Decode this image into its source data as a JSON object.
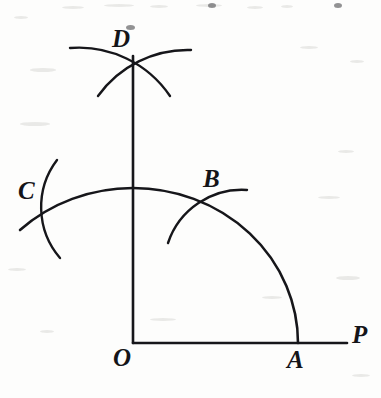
{
  "figure": {
    "canvas": {
      "width": 381,
      "height": 398
    },
    "background_color": "#fdfdfc",
    "ink_color": "#16161a"
  },
  "labels": [
    {
      "id": "D",
      "text": "D",
      "x": 112,
      "y": 26,
      "name": "point-label-d"
    },
    {
      "id": "C",
      "text": "C",
      "x": 18,
      "y": 178,
      "name": "point-label-c"
    },
    {
      "id": "B",
      "text": "B",
      "x": 203,
      "y": 166,
      "name": "point-label-b"
    },
    {
      "id": "O",
      "text": "O",
      "x": 113,
      "y": 345,
      "name": "point-label-o"
    },
    {
      "id": "A",
      "text": "A",
      "x": 287,
      "y": 347,
      "name": "point-label-a"
    },
    {
      "id": "P",
      "text": "P",
      "x": 352,
      "y": 322,
      "name": "point-label-p"
    }
  ],
  "points": {
    "O": {
      "x": 133,
      "y": 343
    },
    "A": {
      "x": 298,
      "y": 343
    },
    "P": {
      "x": 347,
      "y": 343
    },
    "B": {
      "x": 213,
      "y": 206
    },
    "C": {
      "x": 42,
      "y": 208
    },
    "D": {
      "x": 133,
      "y": 70
    },
    "arc_top": {
      "x": 133,
      "y": 188
    }
  },
  "geometry": {
    "horizontal_ray": {
      "x1": 133,
      "y1": 343,
      "x2": 347,
      "y2": 343,
      "label": "ray OP"
    },
    "vertical_ray": {
      "x1": 133,
      "y1": 343,
      "x2": 133,
      "y2": 56,
      "label": "ray OD"
    },
    "main_arc": {
      "d": "M 298 343 A 165 155 0 0 0 133 188 A 165 155 0 0 0 20 230",
      "label": "arc centred at O through A, B, top and C",
      "radius_x": 165,
      "radius_y": 155
    },
    "mark_arc_b": {
      "d": "M 168 243 A 78 78 0 0 1 247 190",
      "label": "compass arc crossing main arc at B"
    },
    "mark_arc_c": {
      "d": "M 57 160 A 78 78 0 0 0 60 258",
      "label": "compass arc crossing main arc at C"
    },
    "mark_arc_d_left": {
      "d": "M 70 48 A 110 110 0 0 1 170 96",
      "label": "compass arc from C crossing at D"
    },
    "mark_arc_d_right": {
      "d": "M 191 50 A 110 110 0 0 0 98 96",
      "label": "compass arc from B crossing at D"
    }
  },
  "specks": [
    {
      "x": 62,
      "y": 6,
      "w": 22,
      "h": 3,
      "dark": false
    },
    {
      "x": 104,
      "y": 4,
      "w": 30,
      "h": 3,
      "dark": false
    },
    {
      "x": 150,
      "y": 5,
      "w": 18,
      "h": 3,
      "dark": false
    },
    {
      "x": 196,
      "y": 4,
      "w": 26,
      "h": 3,
      "dark": false
    },
    {
      "x": 208,
      "y": 3,
      "w": 8,
      "h": 5,
      "dark": true
    },
    {
      "x": 247,
      "y": 6,
      "w": 16,
      "h": 3,
      "dark": false
    },
    {
      "x": 281,
      "y": 5,
      "w": 12,
      "h": 3,
      "dark": false
    },
    {
      "x": 334,
      "y": 3,
      "w": 8,
      "h": 5,
      "dark": true
    },
    {
      "x": 126,
      "y": 25,
      "w": 9,
      "h": 5,
      "dark": true
    },
    {
      "x": 14,
      "y": 16,
      "w": 14,
      "h": 3,
      "dark": false
    },
    {
      "x": 30,
      "y": 68,
      "w": 26,
      "h": 4,
      "dark": false
    },
    {
      "x": 300,
      "y": 46,
      "w": 18,
      "h": 3,
      "dark": false
    },
    {
      "x": 350,
      "y": 60,
      "w": 14,
      "h": 3,
      "dark": false
    },
    {
      "x": 20,
      "y": 122,
      "w": 30,
      "h": 4,
      "dark": false
    },
    {
      "x": 318,
      "y": 196,
      "w": 22,
      "h": 3,
      "dark": false
    },
    {
      "x": 338,
      "y": 150,
      "w": 16,
      "h": 3,
      "dark": false
    },
    {
      "x": 262,
      "y": 296,
      "w": 20,
      "h": 3,
      "dark": false
    },
    {
      "x": 336,
      "y": 276,
      "w": 24,
      "h": 4,
      "dark": false
    },
    {
      "x": 150,
      "y": 318,
      "w": 26,
      "h": 3,
      "dark": false
    },
    {
      "x": 40,
      "y": 330,
      "w": 14,
      "h": 3,
      "dark": false
    },
    {
      "x": 8,
      "y": 268,
      "w": 18,
      "h": 3,
      "dark": false
    },
    {
      "x": 352,
      "y": 374,
      "w": 18,
      "h": 3,
      "dark": false
    }
  ]
}
